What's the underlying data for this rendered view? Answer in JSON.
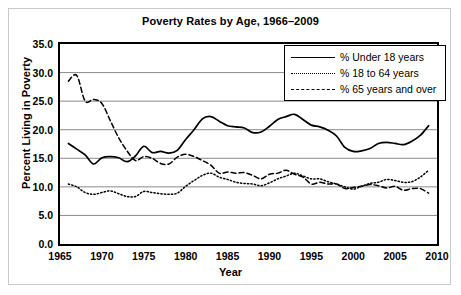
{
  "chart_data": {
    "type": "line",
    "title": "Poverty Rates by Age, 1966–2009",
    "xlabel": "Year",
    "ylabel": "Percent Living in Poverty",
    "xlim": [
      1965,
      2010
    ],
    "ylim": [
      0.0,
      35.0
    ],
    "xticks": [
      "1965",
      "1970",
      "1975",
      "1980",
      "1985",
      "1990",
      "1995",
      "2000",
      "2005",
      "2010"
    ],
    "yticks": [
      "0.0",
      "5.0",
      "10.0",
      "15.0",
      "20.0",
      "25.0",
      "30.0",
      "35.0"
    ],
    "grid": "horizontal",
    "legend_position": "top-right",
    "x": [
      1966,
      1967,
      1968,
      1969,
      1970,
      1971,
      1972,
      1973,
      1974,
      1975,
      1976,
      1977,
      1978,
      1979,
      1980,
      1981,
      1982,
      1983,
      1984,
      1985,
      1986,
      1987,
      1988,
      1989,
      1990,
      1991,
      1992,
      1993,
      1994,
      1995,
      1996,
      1997,
      1998,
      1999,
      2000,
      2001,
      2002,
      2003,
      2004,
      2005,
      2006,
      2007,
      2008,
      2009
    ],
    "series": [
      {
        "name": "% Under 18 years",
        "style": "solid",
        "color": "#000000",
        "values": [
          17.6,
          16.6,
          15.6,
          14.0,
          15.1,
          15.3,
          15.1,
          14.4,
          15.4,
          17.1,
          16.0,
          16.2,
          15.9,
          16.4,
          18.3,
          20.0,
          21.9,
          22.3,
          21.5,
          20.7,
          20.5,
          20.3,
          19.5,
          19.6,
          20.6,
          21.8,
          22.3,
          22.7,
          21.8,
          20.8,
          20.5,
          19.9,
          18.9,
          16.9,
          16.2,
          16.3,
          16.7,
          17.6,
          17.8,
          17.6,
          17.4,
          18.0,
          19.0,
          20.7
        ]
      },
      {
        "name": "% 18 to 64 years",
        "style": "dotted",
        "color": "#000000",
        "values": [
          10.5,
          10.0,
          9.0,
          8.7,
          9.0,
          9.3,
          8.8,
          8.3,
          8.3,
          9.2,
          9.0,
          8.8,
          8.7,
          8.9,
          10.1,
          11.1,
          12.0,
          12.4,
          11.7,
          11.3,
          10.8,
          10.6,
          10.5,
          10.2,
          10.7,
          11.4,
          11.9,
          12.4,
          11.9,
          11.4,
          11.4,
          10.9,
          10.5,
          10.0,
          9.6,
          10.1,
          10.6,
          10.8,
          11.3,
          11.1,
          10.8,
          10.9,
          11.7,
          12.9
        ]
      },
      {
        "name": "% 65 years and over",
        "style": "dashed",
        "color": "#000000",
        "values": [
          28.5,
          29.5,
          25.0,
          25.3,
          24.6,
          21.6,
          18.6,
          16.3,
          14.6,
          15.3,
          15.0,
          14.1,
          14.0,
          15.2,
          15.7,
          15.3,
          14.6,
          13.8,
          12.4,
          12.6,
          12.4,
          12.5,
          12.0,
          11.4,
          12.2,
          12.4,
          12.9,
          12.2,
          11.7,
          10.5,
          10.8,
          10.5,
          10.5,
          9.7,
          9.9,
          10.1,
          10.4,
          10.2,
          9.8,
          10.1,
          9.4,
          9.7,
          9.7,
          8.9
        ]
      }
    ]
  }
}
